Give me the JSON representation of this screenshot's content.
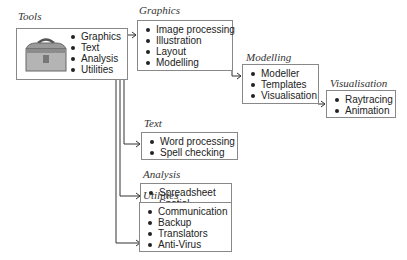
{
  "diagram": {
    "tools": {
      "title": "Tools",
      "items": [
        "Graphics",
        "Text",
        "Analysis",
        "Utilities"
      ],
      "icon": "toolbox-icon"
    },
    "graphics": {
      "title": "Graphics",
      "items": [
        "Image processing",
        "Illustration",
        "Layout",
        "Modelling"
      ]
    },
    "modelling": {
      "title": "Modelling",
      "items": [
        "Modeller",
        "Templates",
        "Visualisation"
      ]
    },
    "visualisation": {
      "title": "Visualisation",
      "items": [
        "Raytracing",
        "Animation"
      ]
    },
    "text": {
      "title": "Text",
      "items": [
        "Word processing",
        "Spell checking"
      ]
    },
    "analysis": {
      "title": "Analysis",
      "items": [
        "Spreadsheet",
        "Spatial"
      ]
    },
    "utilities": {
      "title": "Utilities",
      "items": [
        "Communication",
        "Backup",
        "Translators",
        "Anti-Virus"
      ]
    }
  }
}
